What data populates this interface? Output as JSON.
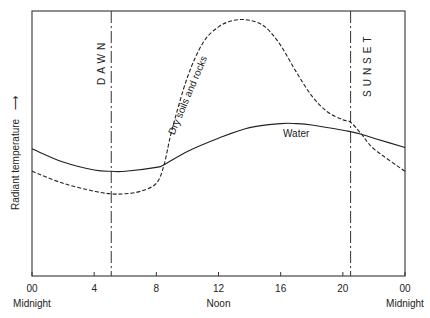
{
  "chart_data": {
    "type": "line",
    "title": "",
    "xlabel": "",
    "ylabel": "Radiant temperature",
    "ylabel_arrow": "up-arrow",
    "x_range": [
      0,
      24
    ],
    "x_ticks": [
      {
        "value": 0,
        "label": "00",
        "sublabel": "Midnight"
      },
      {
        "value": 4,
        "label": "4",
        "sublabel": ""
      },
      {
        "value": 8,
        "label": "8",
        "sublabel": ""
      },
      {
        "value": 12,
        "label": "12",
        "sublabel": "Noon"
      },
      {
        "value": 16,
        "label": "16",
        "sublabel": ""
      },
      {
        "value": 20,
        "label": "20",
        "sublabel": ""
      },
      {
        "value": 24,
        "label": "00",
        "sublabel": "Midnight"
      }
    ],
    "y_units": "relative (0 = bottom of plot, 100 = top)",
    "grid": false,
    "annotations": [
      {
        "type": "vertical-line",
        "x": 5.1,
        "label": "DAWN",
        "style": "dash-dot"
      },
      {
        "type": "vertical-line",
        "x": 20.5,
        "label": "SUNSET",
        "style": "dash-dot"
      }
    ],
    "series": [
      {
        "name": "Water",
        "style": "solid",
        "x": [
          0,
          2,
          4,
          5.1,
          6,
          8,
          8.5,
          10,
          12,
          14,
          16,
          17,
          18,
          20,
          20.5,
          21.2,
          22,
          24
        ],
        "y": [
          48,
          43,
          40,
          39.5,
          39.5,
          41,
          42,
          47,
          52,
          56,
          57.5,
          57.5,
          57,
          55,
          54.5,
          53.5,
          52,
          48.5
        ]
      },
      {
        "name": "Dry soils and rocks",
        "style": "dashed",
        "x": [
          0,
          2,
          4,
          5.1,
          6,
          7,
          8,
          8.5,
          9,
          10,
          11,
          12,
          13,
          14,
          15,
          16,
          17,
          18,
          19,
          20,
          20.5,
          21.2,
          22,
          24
        ],
        "y": [
          39.5,
          35,
          32,
          31,
          31,
          32,
          35,
          42,
          55,
          75,
          88,
          94,
          96.5,
          96.5,
          94,
          87,
          77,
          68,
          62,
          59,
          58,
          53.5,
          48,
          39.5
        ]
      }
    ]
  }
}
